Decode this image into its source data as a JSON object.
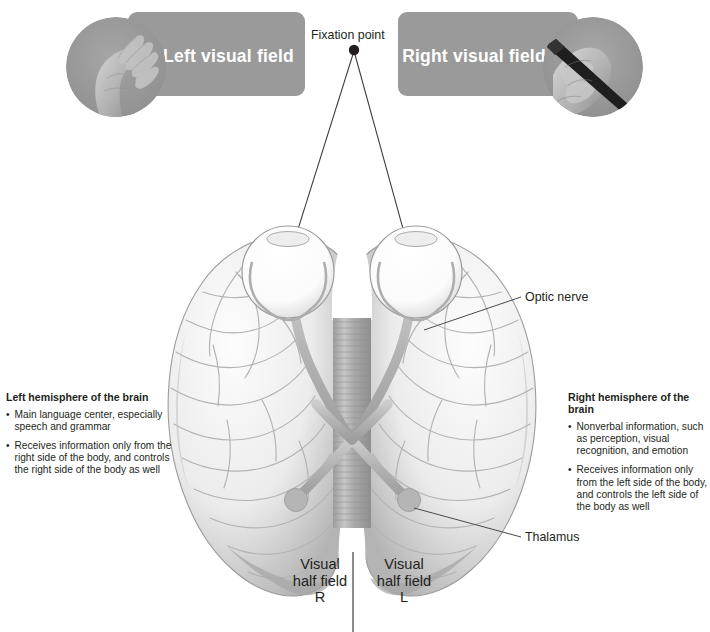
{
  "fields": {
    "left": {
      "label": "Left visual field",
      "photo": "hand-flat-on-surface-photo"
    },
    "right": {
      "label": "Right visual field",
      "photo": "hand-writing-with-pen-photo"
    }
  },
  "fixation": {
    "label": "Fixation point"
  },
  "callouts": {
    "optic_nerve": "Optic nerve",
    "thalamus": "Thalamus"
  },
  "visual_half_fields": {
    "right": {
      "line1": "Visual",
      "line2": "half field",
      "line3": "R"
    },
    "left": {
      "line1": "Visual",
      "line2": "half field",
      "line3": "L"
    }
  },
  "hemispheres": {
    "left": {
      "heading": "Left hemisphere of the brain",
      "bullets": [
        "Main language center, especially speech and grammar",
        "Receives information only from the right side of the body, and controls the right side of the body as well"
      ]
    },
    "right": {
      "heading": "Right hemisphere of the brain",
      "bullets": [
        "Nonverbal information, such as perception, visual recognition, and emotion",
        "Receives information only from the left side of the body, and controls the left side of the body as well"
      ]
    }
  },
  "colors": {
    "plate_gray": "#9a9a9a",
    "text_dark": "#231f20",
    "brain_light": "#f2f2f2",
    "brain_shadow": "#b9b9b9",
    "nerve_gray": "#b0b0b0",
    "leader_line": "#4a4a4a"
  }
}
